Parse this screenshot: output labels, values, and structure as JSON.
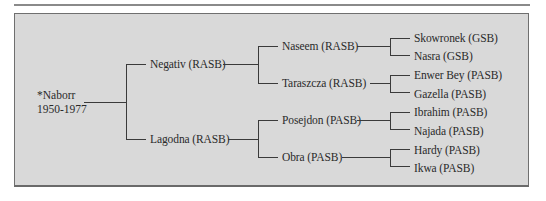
{
  "figure": {
    "type": "pedigree-tree",
    "root": {
      "name": "*Naborr",
      "years": "1950-1977"
    },
    "generation1": [
      {
        "label": "Negativ (RASB)"
      },
      {
        "label": "Lagodna (RASB)"
      }
    ],
    "generation2": [
      {
        "label": "Naseem (RASB)"
      },
      {
        "label": "Taraszcza (RASB)"
      },
      {
        "label": "Posejdon (PASB)"
      },
      {
        "label": "Obra (PASB)"
      }
    ],
    "generation3": [
      {
        "label": "Skowronek (GSB)"
      },
      {
        "label": "Nasra (GSB)"
      },
      {
        "label": "Enwer Bey (PASB)"
      },
      {
        "label": "Gazella (PASB)"
      },
      {
        "label": "Ibrahim (PASB)"
      },
      {
        "label": "Najada (PASB)"
      },
      {
        "label": "Hardy (PASB)"
      },
      {
        "label": "Ikwa (PASB)"
      }
    ]
  },
  "colors": {
    "box_bg": "#d9d9d9",
    "line": "#3a3a3a",
    "border": "#6f6f6f"
  }
}
